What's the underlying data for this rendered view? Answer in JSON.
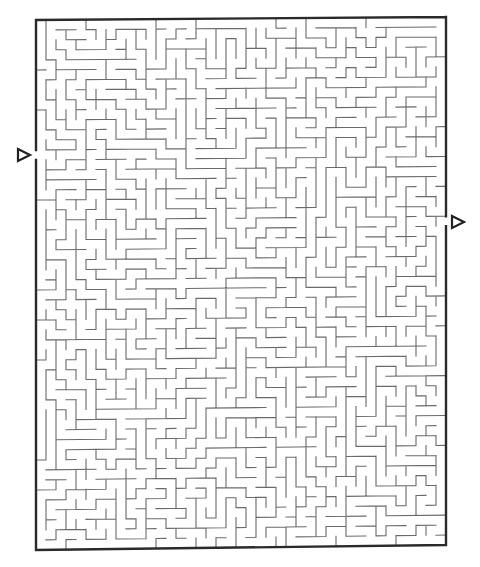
{
  "maze": {
    "border": {
      "x0": 36,
      "y0": 20,
      "x1": 446,
      "y1": 550,
      "skew_top_dy": -3,
      "skew_bottom_dy": -5,
      "color": "#2a2a2a"
    },
    "grid": {
      "cols": 41,
      "rows": 53,
      "cell": 10
    },
    "wall_color": "#6a6a6a",
    "seed": 73519,
    "entrance": {
      "side": "left",
      "row": 13,
      "arrow": {
        "x": 18,
        "y": 155,
        "direction": "right"
      }
    },
    "exit": {
      "side": "right",
      "row": 20,
      "arrow": {
        "x": 452,
        "y": 222,
        "direction": "right"
      }
    }
  }
}
